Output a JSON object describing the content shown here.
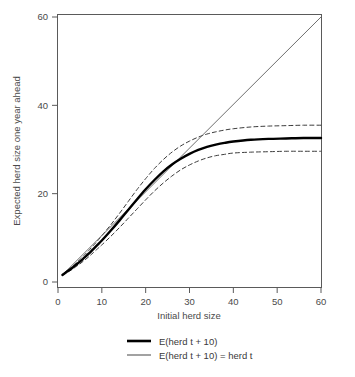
{
  "chart_data": {
    "type": "line",
    "title": "",
    "xlabel": "Initial herd size",
    "ylabel": "Expected herd size one year ahead",
    "xlim": [
      0,
      60
    ],
    "ylim": [
      0,
      60
    ],
    "xticks": [
      0,
      10,
      20,
      30,
      40,
      50,
      60
    ],
    "yticks": [
      0,
      20,
      40,
      60
    ],
    "grid": false,
    "legend_position": "bottom-center",
    "series": [
      {
        "name": "E(herd t + 10)",
        "style": "solid",
        "color": "#000000",
        "width": 2.4,
        "x": [
          1,
          2,
          3,
          4,
          5,
          6,
          7,
          8,
          9,
          10,
          12,
          14,
          16,
          18,
          20,
          22,
          24,
          26,
          28,
          30,
          32,
          34,
          36,
          38,
          40,
          44,
          48,
          52,
          56,
          60
        ],
        "y": [
          1.6,
          2.3,
          3.0,
          3.8,
          4.6,
          5.5,
          6.4,
          7.4,
          8.4,
          9.4,
          11.6,
          13.9,
          16.3,
          18.7,
          21.0,
          23.1,
          25.0,
          26.6,
          27.9,
          29.0,
          29.9,
          30.6,
          31.1,
          31.5,
          31.8,
          32.2,
          32.4,
          32.5,
          32.6,
          32.6
        ]
      },
      {
        "name": "E(herd t + 10) = herd t",
        "style": "solid",
        "color": "#6e6e6e",
        "width": 1.0,
        "x": [
          1,
          60
        ],
        "y": [
          1.6,
          60
        ]
      },
      {
        "name": "upper confidence band",
        "style": "dashed",
        "color": "#3a3a3a",
        "width": 1.0,
        "x": [
          1,
          2,
          3,
          4,
          5,
          6,
          7,
          8,
          9,
          10,
          12,
          14,
          16,
          18,
          20,
          22,
          24,
          26,
          28,
          30,
          32,
          34,
          36,
          38,
          40,
          44,
          48,
          52,
          56,
          60
        ],
        "y": [
          1.7,
          2.5,
          3.3,
          4.2,
          5.1,
          6.1,
          7.1,
          8.2,
          9.3,
          10.5,
          12.9,
          15.5,
          18.2,
          20.9,
          23.4,
          25.7,
          27.7,
          29.4,
          30.8,
          31.9,
          32.8,
          33.5,
          34.0,
          34.4,
          34.7,
          35.1,
          35.3,
          35.4,
          35.5,
          35.5
        ]
      },
      {
        "name": "lower confidence band",
        "style": "dashed",
        "color": "#3a3a3a",
        "width": 1.0,
        "x": [
          1,
          2,
          3,
          4,
          5,
          6,
          7,
          8,
          9,
          10,
          12,
          14,
          16,
          18,
          20,
          22,
          24,
          26,
          28,
          30,
          32,
          34,
          36,
          38,
          40,
          44,
          48,
          52,
          56,
          60
        ],
        "y": [
          1.5,
          2.1,
          2.7,
          3.4,
          4.1,
          4.9,
          5.7,
          6.6,
          7.5,
          8.4,
          10.3,
          12.3,
          14.4,
          16.5,
          18.6,
          20.6,
          22.4,
          24.0,
          25.4,
          26.5,
          27.4,
          28.1,
          28.6,
          28.9,
          29.2,
          29.4,
          29.5,
          29.6,
          29.6,
          29.6
        ]
      }
    ],
    "legend": [
      {
        "label": "E(herd t + 10)",
        "color": "#000000",
        "width": 2.6,
        "style": "solid"
      },
      {
        "label": "E(herd t + 10) = herd t",
        "color": "#7a7a7a",
        "width": 1.4,
        "style": "solid"
      }
    ]
  },
  "caption": {
    "text": ""
  }
}
